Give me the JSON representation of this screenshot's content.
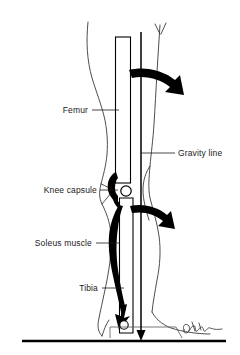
{
  "figure": {
    "background_color": "#ffffff",
    "ink_color": "#000000",
    "outline_color": "#333333"
  },
  "labels": [
    {
      "id": "femur",
      "text": "Femur",
      "text_x": 88,
      "text_y": 113,
      "leader": {
        "x1": 92,
        "y1": 110,
        "x2": 119,
        "y2": 110
      },
      "align": "end"
    },
    {
      "id": "gravity-line",
      "text": "Gravity line",
      "text_x": 178,
      "text_y": 156,
      "leader": {
        "x1": 141,
        "y1": 153,
        "x2": 175,
        "y2": 153
      },
      "align": "start"
    },
    {
      "id": "knee-capsule",
      "text": "Knee capsule",
      "text_x": 97,
      "text_y": 193,
      "leader": {
        "x1": 100,
        "y1": 190,
        "x2": 118,
        "y2": 190
      },
      "align": "end"
    },
    {
      "id": "soleus-muscle",
      "text": "Soleus muscle",
      "text_x": 92,
      "text_y": 246,
      "leader": {
        "x1": 96,
        "y1": 243,
        "x2": 120,
        "y2": 243
      },
      "align": "end"
    },
    {
      "id": "tibia",
      "text": "Tibia",
      "text_x": 98,
      "text_y": 291,
      "leader": {
        "x1": 102,
        "y1": 288,
        "x2": 124,
        "y2": 288
      },
      "align": "end"
    }
  ],
  "structures": {
    "femur": {
      "name": "femur-bone",
      "note": "long vertical shaft, outlined white"
    },
    "tibia": {
      "name": "tibia-bone",
      "note": "lower vertical shaft, outlined white"
    },
    "knee_capsule": {
      "name": "knee-capsule",
      "note": "dark posterior capsule mass"
    },
    "knee_joint_circle": {
      "name": "knee-joint-circle",
      "cx": 126,
      "cy": 191,
      "r": 5.2
    },
    "ankle_joint_circle": {
      "name": "ankle-joint-circle",
      "cx": 124,
      "cy": 325,
      "r": 4.2
    },
    "soleus": {
      "name": "soleus-muscle-belly",
      "note": "solid black tapering calf mass"
    },
    "gravity_line": {
      "name": "gravity-line",
      "x": 141,
      "y_top": 32,
      "y_bottom": 338
    },
    "ground_line": {
      "name": "ground-line",
      "y": 341
    },
    "signature": {
      "name": "artist-signature",
      "x": 183,
      "y": 332
    }
  },
  "arrows": [
    {
      "id": "moment-arrow-knee-extension",
      "label": "upper curved moment arrow"
    },
    {
      "id": "moment-arrow-ankle",
      "label": "lower curved moment arrow"
    },
    {
      "id": "soleus-pull-arrow",
      "label": "downward soleus force arrow"
    },
    {
      "id": "gravity-arrowhead",
      "label": "gravity vector arrowhead"
    }
  ]
}
